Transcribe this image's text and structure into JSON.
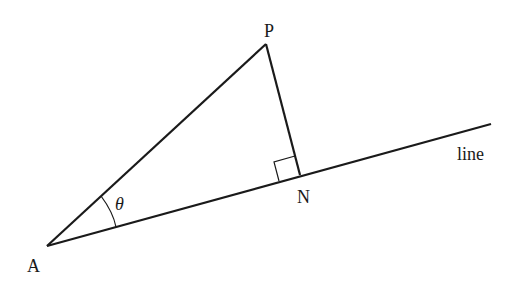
{
  "diagram": {
    "type": "geometry",
    "points": {
      "A": {
        "label": "A",
        "x": 47,
        "y": 246
      },
      "P": {
        "label": "P",
        "x": 266,
        "y": 44
      },
      "N": {
        "label": "N",
        "x": 300,
        "y": 175
      }
    },
    "line_label": "line",
    "angle_label": "θ",
    "stroke_color": "#1a1a1a"
  }
}
